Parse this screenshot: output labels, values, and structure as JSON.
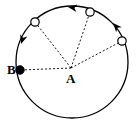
{
  "figure": {
    "type": "geometry-diagram",
    "width": 136,
    "height": 126,
    "background_color": "#ffffff",
    "stroke_color": "#000000"
  },
  "circle": {
    "name": "main-circle",
    "center_x": 72,
    "center_y": 62,
    "radius": 56,
    "stroke_color": "#000000",
    "stroke_width": 1.3,
    "fill": "none"
  },
  "center_point": {
    "name": "point-A",
    "label": "A",
    "x": 71,
    "y": 68,
    "marker": "none"
  },
  "points": [
    {
      "name": "point-B",
      "label": "B",
      "x": 20,
      "y": 70,
      "marker": "filled-circle",
      "radius": 4.2,
      "fill": "#000000"
    },
    {
      "name": "point-top-left",
      "label": "",
      "x": 35,
      "y": 22,
      "marker": "open-circle",
      "radius": 4.2,
      "fill": "#ffffff"
    },
    {
      "name": "point-top-right",
      "label": "",
      "x": 90,
      "y": 12,
      "marker": "open-circle",
      "radius": 4.2,
      "fill": "#ffffff"
    },
    {
      "name": "point-right",
      "label": "",
      "x": 122,
      "y": 41,
      "marker": "open-circle",
      "radius": 4.2,
      "fill": "#ffffff"
    }
  ],
  "radii_lines": [
    {
      "name": "radius-A-to-top-left",
      "style": "dashed",
      "x1": 71,
      "y1": 68,
      "x2": 35,
      "y2": 22
    },
    {
      "name": "radius-A-to-top-right",
      "style": "dashed",
      "x1": 71,
      "y1": 68,
      "x2": 90,
      "y2": 12
    },
    {
      "name": "radius-A-to-right",
      "style": "dashed",
      "x1": 71,
      "y1": 68,
      "x2": 122,
      "y2": 41
    },
    {
      "name": "radius-A-to-B",
      "style": "dashed",
      "x1": 71,
      "y1": 68,
      "x2": 20,
      "y2": 70
    }
  ],
  "arrows": [
    {
      "name": "arrow-top-arc",
      "description": "arrowhead on top arc pointing counterclockwise (to the left)",
      "x": 68,
      "y": 7,
      "angle_deg": 188
    },
    {
      "name": "arrow-upper-right-arc",
      "description": "arrowhead on upper-right arc pointing counterclockwise (up-left)",
      "x": 113,
      "y": 23,
      "angle_deg": 228
    },
    {
      "name": "arrow-left-arc",
      "description": "arrowhead on left arc pointing counterclockwise (down-left)",
      "x": 21,
      "y": 44,
      "angle_deg": 108
    }
  ],
  "line_style": {
    "dash_pattern": "2,2",
    "dash_width": 0.9,
    "arc_width": 1.3,
    "arrow_size": 9
  }
}
